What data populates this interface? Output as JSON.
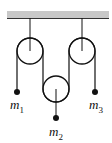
{
  "diagram": {
    "type": "pulley-system",
    "ceiling": {
      "color": "#c8c8c8",
      "edge_color": "#333333"
    },
    "pulleys": [
      {
        "id": "left",
        "cx": 30,
        "cy": 51,
        "r": 13,
        "fixed": true
      },
      {
        "id": "right",
        "cx": 82,
        "cy": 51,
        "r": 13,
        "fixed": true
      },
      {
        "id": "middle",
        "cx": 56,
        "cy": 89,
        "r": 13,
        "fixed": false
      }
    ],
    "masses": [
      {
        "id": "m1",
        "base": "m",
        "sub": "1",
        "x": 17,
        "y": 92
      },
      {
        "id": "m2",
        "base": "m",
        "sub": "2",
        "x": 56,
        "y": 118
      },
      {
        "id": "m3",
        "base": "m",
        "sub": "3",
        "x": 95,
        "y": 92
      }
    ]
  }
}
